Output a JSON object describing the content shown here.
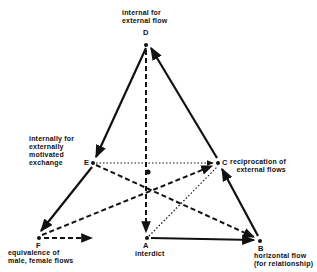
{
  "nodes": {
    "D": {
      "letter": "D",
      "label": "internal for\nexternal flow"
    },
    "E": {
      "letter": "E",
      "label": "internally for\nexternally\nmotivated\nexchange"
    },
    "C": {
      "letter": "C",
      "label": "reciprocation of\n   external flows"
    },
    "F": {
      "letter": "F",
      "label": "equivalence of\nmale, female flows"
    },
    "A": {
      "letter": "A",
      "label": "interdict"
    },
    "B": {
      "letter": "B",
      "label": "horizontal flow\n(for relationship)"
    }
  },
  "edges": [
    {
      "from": "D",
      "to": "E",
      "style": "solid",
      "arrow": "E"
    },
    {
      "from": "E",
      "to": "F",
      "style": "solid",
      "arrow": "F"
    },
    {
      "from": "B",
      "to": "C",
      "style": "solid",
      "arrow": "C"
    },
    {
      "from": "C",
      "to": "D",
      "style": "solid",
      "arrow": "D"
    },
    {
      "from": "A",
      "to": "B",
      "style": "solid",
      "arrow": "B"
    },
    {
      "from": "D",
      "to": "A",
      "style": "dashed",
      "arrow": "A"
    },
    {
      "from": "E",
      "to": "B",
      "style": "dashed",
      "arrow": "B"
    },
    {
      "from": "F",
      "to": "C",
      "style": "dashed",
      "arrow": "C"
    },
    {
      "from": "F",
      "to": "right",
      "style": "dashed",
      "arrow": "right"
    },
    {
      "from": "E",
      "to": "C",
      "style": "dotted",
      "arrow": "C"
    },
    {
      "from": "A",
      "to": "C",
      "style": "dotted",
      "arrow": "none"
    }
  ]
}
